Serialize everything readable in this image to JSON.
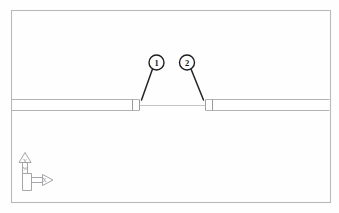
{
  "drawing": {
    "title": "Wall plan with opening",
    "background_color": "#fefefe",
    "frame": {
      "name": "drawing-border",
      "x": 11,
      "y": 10,
      "width": 319,
      "height": 192,
      "stroke_color": "#b9babc"
    },
    "wall": {
      "name": "horizontal-wall",
      "top_y": 99,
      "bottom_y": 110,
      "stroke_color": "#a8aaac",
      "left_segment": {
        "x_start": 11,
        "x_end": 139
      },
      "right_segment": {
        "x_start": 206,
        "x_end": 330
      },
      "opening": {
        "x_start": 139,
        "x_end": 206,
        "centerline_y": 105
      }
    },
    "callouts": [
      {
        "name": "callout-bubble-1",
        "label": "1",
        "circle": {
          "cx": 156.5,
          "cy": 62.5,
          "r": 7.5
        },
        "leader": {
          "x1": 152.5,
          "y1": 69.0,
          "x2": 141.5,
          "y2": 100.0
        }
      },
      {
        "name": "callout-bubble-2",
        "label": "2",
        "circle": {
          "cx": 187.0,
          "cy": 62.5,
          "r": 7.5
        },
        "leader": {
          "x1": 191.0,
          "y1": 69.0,
          "x2": 203.5,
          "y2": 100.0
        }
      }
    ],
    "ucs_icon": {
      "name": "ucs-icon",
      "x_axis_label": "X",
      "y_axis_label": "Y",
      "world_label": "W",
      "origin": {
        "x": 22,
        "y": 190
      },
      "stroke_color": "#9a9c9e"
    }
  }
}
